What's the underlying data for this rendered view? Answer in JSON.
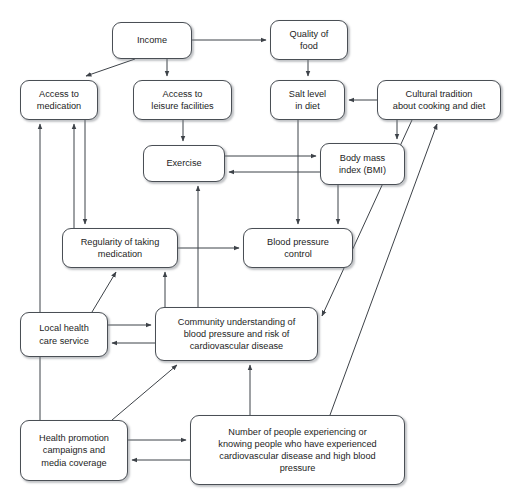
{
  "diagram": {
    "style": {
      "node_fill": "#ffffff",
      "node_border": "#4a4f55",
      "line_color": "#3d4248",
      "text_color": "#1d1d1d",
      "background": "#ffffff"
    },
    "nodes": [
      {
        "id": "income",
        "label": "Income",
        "x": 112,
        "y": 22,
        "w": 80,
        "h": 37
      },
      {
        "id": "quality-of-food",
        "label": "Quality of\nfood",
        "x": 270,
        "y": 20,
        "w": 78,
        "h": 40
      },
      {
        "id": "access-medication",
        "label": "Access to\nmedication",
        "x": 20,
        "y": 80,
        "w": 78,
        "h": 40
      },
      {
        "id": "access-leisure",
        "label": "Access to\nleisure facilities",
        "x": 133,
        "y": 80,
        "w": 99,
        "h": 40
      },
      {
        "id": "salt-level",
        "label": "Salt level\nin diet",
        "x": 270,
        "y": 80,
        "w": 75,
        "h": 40
      },
      {
        "id": "cultural-tradition",
        "label": "Cultural tradition\nabout cooking and diet",
        "x": 377,
        "y": 80,
        "w": 124,
        "h": 40
      },
      {
        "id": "exercise",
        "label": "Exercise",
        "x": 143,
        "y": 145,
        "w": 82,
        "h": 37
      },
      {
        "id": "bmi",
        "label": "Body mass\nindex (BMI)",
        "x": 320,
        "y": 143,
        "w": 85,
        "h": 42
      },
      {
        "id": "regularity",
        "label": "Regularity of taking\nmedication",
        "x": 62,
        "y": 228,
        "w": 116,
        "h": 40
      },
      {
        "id": "bp-control",
        "label": "Blood pressure\ncontrol",
        "x": 243,
        "y": 228,
        "w": 110,
        "h": 40
      },
      {
        "id": "local-health",
        "label": "Local health\ncare service",
        "x": 20,
        "y": 312,
        "w": 88,
        "h": 45
      },
      {
        "id": "community",
        "label": "Community understanding of\nblood pressure and risk of\ncardiovascular disease",
        "x": 155,
        "y": 307,
        "w": 163,
        "h": 54
      },
      {
        "id": "health-promotion",
        "label": "Health promotion\ncampaigns and\nmedia coverage",
        "x": 20,
        "y": 420,
        "w": 108,
        "h": 61
      },
      {
        "id": "number-people",
        "label": "Number of people experiencing or\nknowing people who have experienced\ncardiovascular disease and high blood\npressure",
        "x": 190,
        "y": 415,
        "w": 215,
        "h": 70
      }
    ],
    "edges": [
      {
        "from": "income",
        "to": "quality-of-food",
        "kind": "straight"
      },
      {
        "from": "income",
        "to": "access-medication",
        "kind": "diagonal"
      },
      {
        "from": "income",
        "to": "access-leisure",
        "kind": "straight"
      },
      {
        "from": "quality-of-food",
        "to": "salt-level",
        "kind": "straight"
      },
      {
        "from": "cultural-tradition",
        "to": "salt-level",
        "kind": "straight"
      },
      {
        "from": "cultural-tradition",
        "to": "bmi",
        "kind": "straight"
      },
      {
        "from": "access-leisure",
        "to": "exercise",
        "kind": "straight"
      },
      {
        "from": "exercise",
        "to": "bmi",
        "kind": "straight"
      },
      {
        "from": "bmi",
        "to": "exercise",
        "kind": "straight"
      },
      {
        "from": "salt-level",
        "to": "bp-control",
        "kind": "straight"
      },
      {
        "from": "bmi",
        "to": "bp-control",
        "kind": "straight"
      },
      {
        "from": "regularity",
        "to": "bp-control",
        "kind": "straight"
      },
      {
        "from": "regularity",
        "to": "access-medication",
        "kind": "straight"
      },
      {
        "from": "access-medication",
        "to": "regularity",
        "kind": "straight"
      },
      {
        "from": "community",
        "to": "exercise",
        "kind": "straight"
      },
      {
        "from": "community",
        "to": "regularity",
        "kind": "straight"
      },
      {
        "from": "local-health",
        "to": "community",
        "kind": "straight"
      },
      {
        "from": "community",
        "to": "local-health",
        "kind": "straight"
      },
      {
        "from": "local-health",
        "to": "regularity",
        "kind": "diagonal"
      },
      {
        "from": "health-promotion",
        "to": "access-medication",
        "kind": "straight"
      },
      {
        "from": "health-promotion",
        "to": "community",
        "kind": "diagonal"
      },
      {
        "from": "health-promotion",
        "to": "number-people",
        "kind": "straight"
      },
      {
        "from": "number-people",
        "to": "health-promotion",
        "kind": "straight"
      },
      {
        "from": "number-people",
        "to": "community",
        "kind": "straight"
      },
      {
        "from": "number-people",
        "to": "cultural-tradition",
        "kind": "diagonal"
      },
      {
        "from": "cultural-tradition",
        "to": "community",
        "kind": "diagonal"
      }
    ]
  }
}
